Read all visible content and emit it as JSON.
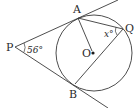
{
  "diagram": {
    "title": "",
    "stroke_color": "#3a3a3a",
    "background": "#ffffff",
    "points": {
      "P": {
        "label": "P",
        "x": 15,
        "y": 47
      },
      "A": {
        "label": "A",
        "x": 78,
        "y": 18
      },
      "B": {
        "label": "B",
        "x": 75,
        "y": 84
      },
      "Q": {
        "label": "Q",
        "x": 123,
        "y": 28
      },
      "O": {
        "label": "O",
        "x": 93,
        "y": 53
      }
    },
    "circle": {
      "center": "O",
      "cx": 93,
      "cy": 53,
      "r": 38
    },
    "angles": {
      "at_P": {
        "label": "56°",
        "value": 56
      },
      "at_Q": {
        "label": "x°",
        "value": "x"
      }
    },
    "segments": [
      "PA (tangent, extended)",
      "PB (tangent, extended)",
      "AQ",
      "BQ",
      "AO"
    ],
    "relations": [
      "PA tangent to circle at A",
      "PB tangent to circle at B",
      "Q on circle"
    ]
  }
}
